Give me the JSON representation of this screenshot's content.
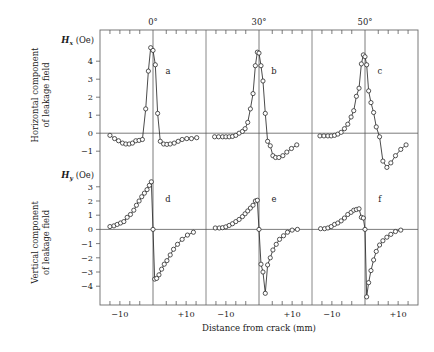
{
  "figure": {
    "background": "#ffffff",
    "marker_color": "#ffffff",
    "line_color": "#2b2b2b",
    "axis_color": "#5a5a5a"
  },
  "labels": {
    "x_axis_title": "Distance from crack (mm)",
    "top_labels": [
      "0°",
      "30°",
      "50°"
    ],
    "row1_side_caption_line1": "Horizontal component",
    "row1_side_caption_line2": "of leakage field",
    "row2_side_caption_line1": "Vertical component",
    "row2_side_caption_line2": "of leakage field",
    "row1_axis_symbol": "H",
    "row1_axis_subscript": "x",
    "row1_axis_unit": "(Oe)",
    "row2_axis_symbol": "H",
    "row2_axis_subscript": "y",
    "row2_axis_unit": "(Oe)",
    "panel_letters": [
      "a",
      "b",
      "c",
      "d",
      "e",
      "f"
    ],
    "x_tick_labels": [
      "−10",
      "+10"
    ],
    "row1_y_tick_labels": [
      "4",
      "3",
      "2",
      "1",
      "0",
      "−1"
    ],
    "row2_y_tick_labels": [
      "3",
      "2",
      "1",
      "0",
      "−1",
      "−2",
      "−3",
      "−4"
    ]
  },
  "chart_data": {
    "type": "line",
    "title": "",
    "xlabel": "Distance from crack (mm)",
    "grid": false,
    "legend": "none",
    "panel_layout": {
      "rows": 2,
      "cols": 3
    },
    "column_headers": [
      "0°",
      "30°",
      "50°"
    ],
    "row_labels": [
      "Horizontal component of leakage field",
      "Vertical component of leakage field"
    ],
    "xlim": [
      -16,
      16
    ],
    "x_ticks": [
      -10,
      10
    ],
    "panels": [
      {
        "id": "a",
        "row": 0,
        "col": 0,
        "angle": "0°",
        "ylabel": "Hx (Oe)",
        "ylim": [
          -1.6,
          5.4
        ],
        "y_ticks": [
          -1,
          0,
          1,
          2,
          3,
          4
        ],
        "x": [
          -13.0,
          -11.6,
          -10.4,
          -9.2,
          -8.2,
          -7.2,
          -6.2,
          -5.2,
          -4.2,
          -3.2,
          -2.2,
          -1.4,
          -0.7,
          0.0,
          0.7,
          1.4,
          2.2,
          3.2,
          4.2,
          5.2,
          6.4,
          7.6,
          8.8,
          10.2,
          11.6,
          13.2
        ],
        "y": [
          -0.12,
          -0.3,
          -0.42,
          -0.55,
          -0.6,
          -0.6,
          -0.55,
          -0.42,
          -0.4,
          -0.35,
          1.35,
          3.45,
          4.75,
          4.6,
          3.8,
          1.1,
          -0.45,
          -0.6,
          -0.62,
          -0.6,
          -0.55,
          -0.45,
          -0.35,
          -0.3,
          -0.3,
          -0.25
        ]
      },
      {
        "id": "b",
        "row": 0,
        "col": 1,
        "angle": "30°",
        "ylabel": "Hx (Oe)",
        "ylim": [
          -1.6,
          5.4
        ],
        "y_ticks": [
          -1,
          0,
          1,
          2,
          3,
          4
        ],
        "x": [
          -13.4,
          -12.2,
          -11.0,
          -10.0,
          -9.0,
          -8.0,
          -7.0,
          -6.0,
          -5.0,
          -4.2,
          -3.4,
          -2.6,
          -1.8,
          -1.1,
          -0.5,
          0.0,
          0.6,
          1.2,
          1.9,
          2.6,
          3.4,
          4.2,
          5.0,
          6.0,
          7.2,
          8.4,
          9.8,
          11.4
        ],
        "y": [
          -0.2,
          -0.2,
          -0.2,
          -0.2,
          -0.2,
          -0.18,
          -0.12,
          0.0,
          0.1,
          0.25,
          0.6,
          1.35,
          2.2,
          3.75,
          4.5,
          4.45,
          3.75,
          2.9,
          1.1,
          -0.45,
          -0.7,
          -1.25,
          -1.35,
          -1.35,
          -1.25,
          -1.05,
          -0.85,
          -0.65
        ]
      },
      {
        "id": "c",
        "row": 0,
        "col": 2,
        "angle": "50°",
        "ylabel": "Hx (Oe)",
        "ylim": [
          -1.6,
          5.4
        ],
        "y_ticks": [
          -1,
          0,
          1,
          2,
          3,
          4
        ],
        "x": [
          -13.6,
          -12.4,
          -11.2,
          -10.2,
          -9.2,
          -8.2,
          -7.2,
          -6.2,
          -5.2,
          -4.2,
          -3.4,
          -2.6,
          -1.8,
          -1.1,
          -0.5,
          0.0,
          0.5,
          1.1,
          1.8,
          2.6,
          3.4,
          4.4,
          5.4,
          6.6,
          7.8,
          9.2,
          10.8,
          12.4
        ],
        "y": [
          -0.15,
          -0.15,
          -0.15,
          -0.15,
          -0.12,
          -0.05,
          0.05,
          0.25,
          0.5,
          0.9,
          1.25,
          2.05,
          2.5,
          3.85,
          4.35,
          4.25,
          3.8,
          2.35,
          1.7,
          1.15,
          0.35,
          -0.2,
          -1.55,
          -1.9,
          -1.65,
          -1.25,
          -0.9,
          -0.65
        ]
      },
      {
        "id": "d",
        "row": 1,
        "col": 0,
        "angle": "0°",
        "ylabel": "Hy (Oe)",
        "ylim": [
          -4.9,
          3.9
        ],
        "y_ticks": [
          -4,
          -3,
          -2,
          -1,
          0,
          1,
          2,
          3
        ],
        "x": [
          -13.0,
          -11.8,
          -10.8,
          -9.8,
          -8.8,
          -7.8,
          -6.8,
          -5.8,
          -5.0,
          -4.2,
          -3.4,
          -2.6,
          -1.8,
          -1.1,
          -0.5,
          0.0,
          0.5,
          1.1,
          1.8,
          2.6,
          3.4,
          4.2,
          5.2,
          6.2,
          7.4,
          8.8,
          10.4,
          12.2
        ],
        "y": [
          0.2,
          0.25,
          0.35,
          0.45,
          0.55,
          0.85,
          1.05,
          1.35,
          1.7,
          2.0,
          2.3,
          2.55,
          2.8,
          3.1,
          3.35,
          0.0,
          -3.5,
          -3.45,
          -3.2,
          -2.8,
          -2.45,
          -2.2,
          -1.8,
          -1.4,
          -1.05,
          -0.7,
          -0.4,
          -0.2
        ]
      },
      {
        "id": "e",
        "row": 1,
        "col": 1,
        "angle": "30°",
        "ylabel": "Hy (Oe)",
        "ylim": [
          -4.9,
          3.9
        ],
        "y_ticks": [
          -4,
          -3,
          -2,
          -1,
          0,
          1,
          2,
          3
        ],
        "x": [
          -13.2,
          -12.0,
          -11.0,
          -10.0,
          -9.0,
          -8.0,
          -7.0,
          -6.0,
          -5.0,
          -4.2,
          -3.4,
          -2.6,
          -1.8,
          -1.1,
          -0.5,
          0.0,
          0.6,
          1.2,
          1.9,
          2.6,
          3.4,
          4.2,
          5.2,
          6.2,
          7.4,
          8.6,
          10.0,
          11.6
        ],
        "y": [
          0.1,
          0.1,
          0.12,
          0.18,
          0.28,
          0.4,
          0.55,
          0.7,
          0.9,
          1.1,
          1.3,
          1.5,
          1.7,
          2.0,
          2.05,
          0.0,
          -2.45,
          -3.0,
          -4.5,
          -2.5,
          -2.0,
          -1.45,
          -1.05,
          -0.7,
          -0.45,
          -0.2,
          -0.05,
          0.0
        ]
      },
      {
        "id": "f",
        "row": 1,
        "col": 2,
        "angle": "50°",
        "ylabel": "Hy (Oe)",
        "ylim": [
          -4.9,
          3.9
        ],
        "y_ticks": [
          -4,
          -3,
          -2,
          -1,
          0,
          1,
          2,
          3
        ],
        "x": [
          -13.4,
          -12.2,
          -11.2,
          -10.2,
          -9.2,
          -8.2,
          -7.2,
          -6.2,
          -5.2,
          -4.2,
          -3.4,
          -2.6,
          -1.8,
          -1.1,
          -0.5,
          0.0,
          0.5,
          1.1,
          1.8,
          2.6,
          3.4,
          4.4,
          5.4,
          6.6,
          7.8,
          9.2,
          10.8
        ],
        "y": [
          0.05,
          0.05,
          0.1,
          0.2,
          0.35,
          0.45,
          0.6,
          0.8,
          1.05,
          1.2,
          1.35,
          1.4,
          1.45,
          0.85,
          0.8,
          0.0,
          -4.75,
          -3.75,
          -2.9,
          -2.15,
          -1.55,
          -1.1,
          -0.8,
          -0.55,
          -0.35,
          -0.15,
          -0.05
        ]
      }
    ]
  }
}
